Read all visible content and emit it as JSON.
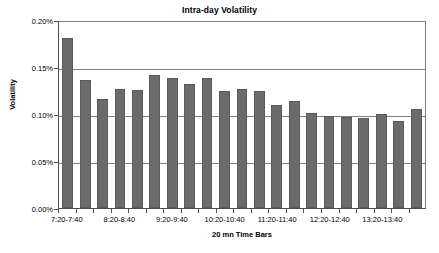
{
  "chart_data": {
    "type": "bar",
    "title": "Intra-day Volatility",
    "xlabel": "20 mn Time Bars",
    "ylabel": "Volatility",
    "ylim": [
      0,
      0.002
    ],
    "ytick_labels": [
      "0.20%",
      "0.15%",
      "0.10%",
      "0.05%",
      "0.00%"
    ],
    "ytick_values": [
      0.002,
      0.0015,
      0.001,
      0.0005,
      0
    ],
    "grid": "horizontal",
    "legend": "none",
    "bar_color": "#6b6b6b",
    "categories": [
      "7:20-7:40",
      "7:40-8:00",
      "8:00-8:20",
      "8:20-8:40",
      "8:40-9:00",
      "9:00-9:20",
      "9:20-9:40",
      "9:40-10:00",
      "10:00-10:20",
      "10:20-10:40",
      "10:40-11:00",
      "11:00-11:20",
      "11:20-11:40",
      "11:40-12:00",
      "12:00-12:20",
      "12:20-12:40",
      "12:40-13:00",
      "13:00-13:20",
      "13:20-13:40",
      "13:40-14:00",
      "14:00-14:20"
    ],
    "visible_xtick_labels": [
      "7:20-7:40",
      "",
      "",
      "8:20-8:40",
      "",
      "",
      "9:20-9:40",
      "",
      "",
      "10:20-10:40",
      "",
      "",
      "11:20-11:40",
      "",
      "",
      "12:20-12:40",
      "",
      "",
      "13:20-13:40",
      "",
      ""
    ],
    "values_percent": [
      0.181,
      0.136,
      0.116,
      0.127,
      0.126,
      0.141,
      0.138,
      0.132,
      0.138,
      0.124,
      0.127,
      0.124,
      0.11,
      0.114,
      0.101,
      0.098,
      0.097,
      0.096,
      0.1,
      0.093,
      0.105
    ],
    "values": [
      0.00181,
      0.00136,
      0.00116,
      0.00127,
      0.00126,
      0.00141,
      0.00138,
      0.00132,
      0.00138,
      0.00124,
      0.00127,
      0.00124,
      0.0011,
      0.00114,
      0.00101,
      0.00098,
      0.00097,
      0.00096,
      0.001,
      0.00093,
      0.00105
    ]
  }
}
